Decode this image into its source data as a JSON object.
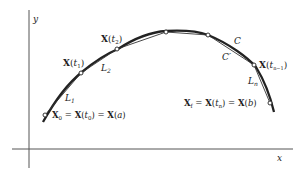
{
  "figure": {
    "axes": {
      "x_label": "x",
      "y_label": "y"
    },
    "curve_label": "C",
    "chord_label": "C′",
    "segments": [
      {
        "name": "L1",
        "sym": "L",
        "sub": "1"
      },
      {
        "name": "L2",
        "sym": "L",
        "sub": "2"
      },
      {
        "name": "Ln",
        "sym": "L",
        "sub": "n"
      }
    ],
    "points": {
      "start": {
        "lhs": "X",
        "lhs_sub": "0",
        "mid": "X",
        "mid_arg": "t",
        "mid_sub": "0",
        "rhs": "X",
        "rhs_arg": "a"
      },
      "t1": {
        "sym": "X",
        "arg": "t",
        "sub": "1"
      },
      "t2": {
        "sym": "X",
        "arg": "t",
        "sub": "2"
      },
      "tn_minus_1": {
        "sym": "X",
        "arg": "t",
        "sub": "n−1"
      },
      "end": {
        "lhs": "X",
        "lhs_sub": "f",
        "mid": "X",
        "mid_arg": "t",
        "mid_sub": "n",
        "rhs": "X",
        "rhs_arg": "b"
      }
    },
    "colors": {
      "ink": "#222222",
      "axis": "#555555",
      "background": "#ffffff"
    }
  }
}
